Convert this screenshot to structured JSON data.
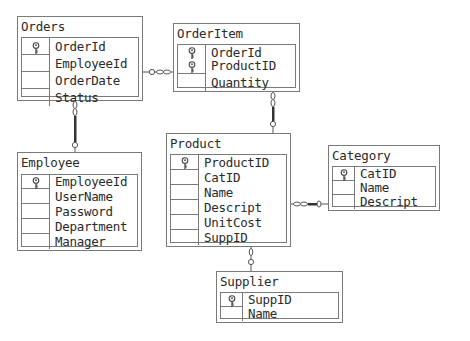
{
  "diagram": {
    "tables": [
      {
        "id": "orders",
        "name": "Orders",
        "fields": [
          {
            "name": "OrderId",
            "pk": true
          },
          {
            "name": "EmployeeId",
            "pk": false
          },
          {
            "name": "OrderDate",
            "pk": false
          },
          {
            "name": "Status",
            "pk": false
          }
        ]
      },
      {
        "id": "orderitem",
        "name": "OrderItem",
        "fields": [
          {
            "name": "OrderId",
            "pk": true
          },
          {
            "name": "ProductID",
            "pk": true
          },
          {
            "name": "Quantity",
            "pk": false
          }
        ]
      },
      {
        "id": "employee",
        "name": "Employee",
        "fields": [
          {
            "name": "EmployeeId",
            "pk": true
          },
          {
            "name": "UserName",
            "pk": false
          },
          {
            "name": "Password",
            "pk": false
          },
          {
            "name": "Department",
            "pk": false
          },
          {
            "name": "Manager",
            "pk": false
          }
        ]
      },
      {
        "id": "product",
        "name": "Product",
        "fields": [
          {
            "name": "ProductID",
            "pk": true
          },
          {
            "name": "CatID",
            "pk": false
          },
          {
            "name": "Name",
            "pk": false
          },
          {
            "name": "Descript",
            "pk": false
          },
          {
            "name": "UnitCost",
            "pk": false
          },
          {
            "name": "SuppID",
            "pk": false
          }
        ]
      },
      {
        "id": "category",
        "name": "Category",
        "fields": [
          {
            "name": "CatID",
            "pk": true
          },
          {
            "name": "Name",
            "pk": false
          },
          {
            "name": "Descript",
            "pk": false
          }
        ]
      },
      {
        "id": "supplier",
        "name": "Supplier",
        "fields": [
          {
            "name": "SuppID",
            "pk": true
          },
          {
            "name": "Name",
            "pk": false
          }
        ]
      }
    ],
    "relationships": [
      {
        "from": "orders",
        "to": "orderitem",
        "one": "orders",
        "many": "orderitem"
      },
      {
        "from": "employee",
        "to": "orders",
        "one": "employee",
        "many": "orders"
      },
      {
        "from": "product",
        "to": "orderitem",
        "one": "product",
        "many": "orderitem"
      },
      {
        "from": "category",
        "to": "product",
        "one": "category",
        "many": "product"
      },
      {
        "from": "supplier",
        "to": "product",
        "one": "supplier",
        "many": "product"
      }
    ]
  }
}
